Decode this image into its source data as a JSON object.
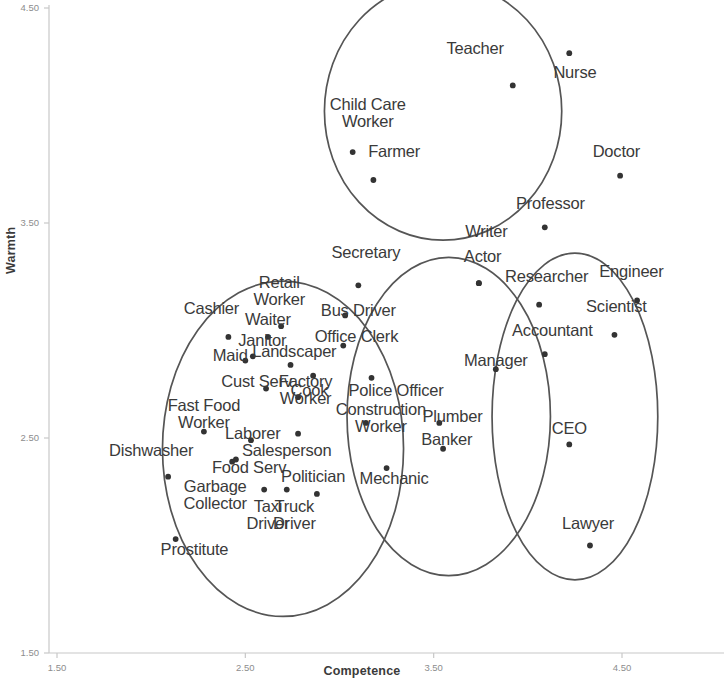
{
  "chart_data": {
    "type": "scatter",
    "title": "",
    "xlabel": "Competence",
    "ylabel": "Warmth",
    "xlim": [
      1.5,
      4.5
    ],
    "ylim": [
      1.5,
      4.5
    ],
    "xticks": [
      "1.50",
      "2.50",
      "3.50",
      "4.50"
    ],
    "yticks": [
      "1.50",
      "2.50",
      "3.50",
      "4.50"
    ],
    "grid": false,
    "legend": "none",
    "marker_color": "#333333",
    "ellipse_color": "#555555",
    "axis_color": "#c8c8c8",
    "annotation_note": "Four overlapping ellipses group occupations into stereotype content quadrant clusters",
    "clusters": [
      {
        "name": "admired-cluster",
        "cx": 2.7,
        "cy": 2.45,
        "rx": 0.64,
        "ry": 0.78,
        "rotation": 0
      },
      {
        "name": "paternalized-cluster",
        "cx": 3.55,
        "cy": 4.02,
        "rx": 0.63,
        "ry": 0.6,
        "rotation": 0
      },
      {
        "name": "mixed-cluster",
        "cx": 3.58,
        "cy": 2.6,
        "rx": 0.54,
        "ry": 0.74,
        "rotation": 0
      },
      {
        "name": "competent-cluster",
        "cx": 4.25,
        "cy": 2.6,
        "rx": 0.44,
        "ry": 0.76,
        "rotation": 0
      }
    ],
    "points": [
      {
        "label": "Teacher",
        "x": 3.92,
        "y": 4.14,
        "lx": 3.72,
        "ly": 4.31,
        "lines": [
          "Teacher"
        ]
      },
      {
        "label": "Nurse",
        "x": 4.22,
        "y": 4.29,
        "lx": 4.25,
        "ly": 4.2,
        "lines": [
          "Nurse"
        ]
      },
      {
        "label": "Child Care Worker",
        "x": 3.07,
        "y": 3.83,
        "lx": 3.15,
        "ly": 4.05,
        "lines": [
          "Child Care",
          "Worker"
        ]
      },
      {
        "label": "Farmer",
        "x": 3.18,
        "y": 3.7,
        "lx": 3.29,
        "ly": 3.83,
        "lines": [
          "Farmer"
        ]
      },
      {
        "label": "Doctor",
        "x": 4.49,
        "y": 3.72,
        "lx": 4.47,
        "ly": 3.83,
        "lines": [
          "Doctor"
        ]
      },
      {
        "label": "Professor",
        "x": 4.09,
        "y": 3.48,
        "lx": 4.12,
        "ly": 3.59,
        "lines": [
          "Professor"
        ]
      },
      {
        "label": "Writer",
        "x": 3.74,
        "y": 3.22,
        "lx": 3.78,
        "ly": 3.46,
        "lines": [
          "Writer"
        ]
      },
      {
        "label": "Actor",
        "x": 3.74,
        "y": 3.22,
        "lx": 3.76,
        "ly": 3.34,
        "lines": [
          "Actor"
        ]
      },
      {
        "label": "Secretary",
        "x": 3.1,
        "y": 3.21,
        "lx": 3.14,
        "ly": 3.36,
        "lines": [
          "Secretary"
        ]
      },
      {
        "label": "Researcher",
        "x": 4.06,
        "y": 3.12,
        "lx": 4.1,
        "ly": 3.25,
        "lines": [
          "Researcher"
        ]
      },
      {
        "label": "Engineer",
        "x": 4.58,
        "y": 3.14,
        "lx": 4.55,
        "ly": 3.27,
        "lines": [
          "Engineer"
        ]
      },
      {
        "label": "Retail Worker",
        "x": 2.69,
        "y": 3.02,
        "lx": 2.68,
        "ly": 3.22,
        "lines": [
          "Retail",
          "Worker"
        ]
      },
      {
        "label": "Bus Driver",
        "x": 3.03,
        "y": 3.07,
        "lx": 3.1,
        "ly": 3.09,
        "lines": [
          "Bus Driver"
        ]
      },
      {
        "label": "Scientist",
        "x": 4.46,
        "y": 2.98,
        "lx": 4.47,
        "ly": 3.11,
        "lines": [
          "Scientist"
        ]
      },
      {
        "label": "Cashier",
        "x": 2.41,
        "y": 2.97,
        "lx": 2.32,
        "ly": 3.1,
        "lines": [
          "Cashier"
        ]
      },
      {
        "label": "Waiter",
        "x": 2.62,
        "y": 2.97,
        "lx": 2.62,
        "ly": 3.05,
        "lines": [
          "Waiter"
        ]
      },
      {
        "label": "Accountant",
        "x": 4.09,
        "y": 2.89,
        "lx": 4.13,
        "ly": 3.0,
        "lines": [
          "Accountant"
        ]
      },
      {
        "label": "Office Clerk",
        "x": 3.02,
        "y": 2.93,
        "lx": 3.09,
        "ly": 2.97,
        "lines": [
          "Office Clerk"
        ]
      },
      {
        "label": "Janitor",
        "x": 2.54,
        "y": 2.88,
        "lx": 2.59,
        "ly": 2.95,
        "lines": [
          "Janitor"
        ]
      },
      {
        "label": "Maid",
        "x": 2.5,
        "y": 2.86,
        "lx": 2.42,
        "ly": 2.88,
        "lines": [
          "Maid"
        ]
      },
      {
        "label": "Landscaper",
        "x": 2.74,
        "y": 2.84,
        "lx": 2.76,
        "ly": 2.9,
        "lines": [
          "Landscaper"
        ]
      },
      {
        "label": "Manager",
        "x": 3.83,
        "y": 2.82,
        "lx": 3.83,
        "ly": 2.86,
        "lines": [
          "Manager"
        ]
      },
      {
        "label": "Cust Serv",
        "x": 2.61,
        "y": 2.73,
        "lx": 2.56,
        "ly": 2.76,
        "lines": [
          "Cust Serv"
        ]
      },
      {
        "label": "Cook",
        "x": 2.86,
        "y": 2.79,
        "lx": 2.84,
        "ly": 2.72,
        "lines": [
          "Cook"
        ]
      },
      {
        "label": "Police Officer",
        "x": 3.17,
        "y": 2.78,
        "lx": 3.3,
        "ly": 2.72,
        "lines": [
          "Police Officer"
        ]
      },
      {
        "label": "Factory Worker",
        "x": 2.78,
        "y": 2.69,
        "lx": 2.82,
        "ly": 2.76,
        "lines": [
          "Factory",
          "Worker"
        ]
      },
      {
        "label": "Fast Food Worker",
        "x": 2.28,
        "y": 2.53,
        "lx": 2.28,
        "ly": 2.65,
        "lines": [
          "Fast Food",
          "Worker"
        ]
      },
      {
        "label": "Construction Worker",
        "x": 3.14,
        "y": 2.57,
        "lx": 3.22,
        "ly": 2.63,
        "lines": [
          "Construction",
          "Worker"
        ]
      },
      {
        "label": "Plumber",
        "x": 3.53,
        "y": 2.57,
        "lx": 3.6,
        "ly": 2.6,
        "lines": [
          "Plumber"
        ]
      },
      {
        "label": "Laborer",
        "x": 2.53,
        "y": 2.49,
        "lx": 2.54,
        "ly": 2.52,
        "lines": [
          "Laborer"
        ]
      },
      {
        "label": "CEO",
        "x": 4.22,
        "y": 2.47,
        "lx": 4.22,
        "ly": 2.54,
        "lines": [
          "CEO"
        ]
      },
      {
        "label": "Salesperson",
        "x": 2.78,
        "y": 2.52,
        "lx": 2.72,
        "ly": 2.44,
        "lines": [
          "Salesperson"
        ]
      },
      {
        "label": "Banker",
        "x": 3.55,
        "y": 2.45,
        "lx": 3.57,
        "ly": 2.49,
        "lines": [
          "Banker"
        ]
      },
      {
        "label": "Dishwasher",
        "x": 2.09,
        "y": 2.32,
        "lx": 2.0,
        "ly": 2.44,
        "lines": [
          "Dishwasher"
        ]
      },
      {
        "label": "Food Serv",
        "x": 2.45,
        "y": 2.4,
        "lx": 2.52,
        "ly": 2.36,
        "lines": [
          "Food Serv"
        ]
      },
      {
        "label": "Mechanic",
        "x": 3.25,
        "y": 2.36,
        "lx": 3.29,
        "ly": 2.31,
        "lines": [
          "Mechanic"
        ]
      },
      {
        "label": "Politician",
        "x": 2.88,
        "y": 2.24,
        "lx": 2.86,
        "ly": 2.32,
        "lines": [
          "Politician"
        ]
      },
      {
        "label": "Garbage Collector",
        "x": 2.43,
        "y": 2.39,
        "lx": 2.34,
        "ly": 2.27,
        "lines": [
          "Garbage",
          "Collector"
        ]
      },
      {
        "label": "Taxi Driver",
        "x": 2.6,
        "y": 2.26,
        "lx": 2.62,
        "ly": 2.18,
        "lines": [
          "Taxi",
          "Driver"
        ]
      },
      {
        "label": "Truck Driver",
        "x": 2.72,
        "y": 2.26,
        "lx": 2.76,
        "ly": 2.18,
        "lines": [
          "Truck",
          "Driver"
        ]
      },
      {
        "label": "Lawyer",
        "x": 4.33,
        "y": 2.0,
        "lx": 4.32,
        "ly": 2.1,
        "lines": [
          "Lawyer"
        ]
      },
      {
        "label": "Prostitute",
        "x": 2.13,
        "y": 2.03,
        "lx": 2.23,
        "ly": 1.98,
        "lines": [
          "Prostitute"
        ]
      }
    ]
  }
}
